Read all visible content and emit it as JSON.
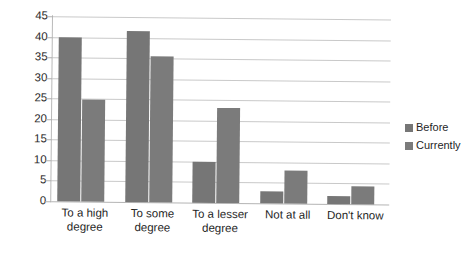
{
  "chart_data": {
    "type": "bar",
    "title": "",
    "subtitle": "",
    "xlabel": "",
    "ylabel": "",
    "categories": [
      "To a high degree",
      "To some degree",
      "To a lesser degree",
      "Not at all",
      "Don't know"
    ],
    "category_lines": [
      [
        "To a high",
        "degree"
      ],
      [
        "To some",
        "degree"
      ],
      [
        "To a lesser",
        "degree"
      ],
      [
        "Not at all",
        ""
      ],
      [
        "Don't know",
        ""
      ]
    ],
    "series": [
      {
        "name": "Before",
        "color": "#767676",
        "values": [
          40,
          41.5,
          10,
          3,
          2
        ]
      },
      {
        "name": "Currently",
        "color": "#7b7b7b",
        "values": [
          24.8,
          35.5,
          23,
          8,
          4.5
        ]
      }
    ],
    "ylim": [
      0,
      45
    ],
    "ytick_step": 5,
    "yticks": [
      "45",
      "40",
      "35",
      "30",
      "25",
      "20",
      "15",
      "10",
      "5",
      "0"
    ],
    "grid": true,
    "legend_position": "right"
  },
  "legend": {
    "items": [
      {
        "label": "Before",
        "color": "#767676"
      },
      {
        "label": "Currently",
        "color": "#7b7b7b"
      }
    ]
  }
}
